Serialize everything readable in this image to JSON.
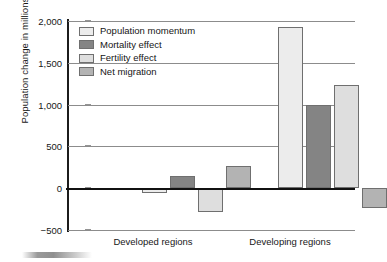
{
  "chart_data": {
    "type": "bar",
    "title": "",
    "xlabel": "",
    "ylabel": "Population change in millions",
    "ylim": [
      -500,
      2000
    ],
    "ytick_labels": [
      "2,000",
      "1,500",
      "1,000",
      "500",
      "0",
      "-500"
    ],
    "ytick_values": [
      2000,
      1500,
      1000,
      500,
      0,
      -500
    ],
    "grid": true,
    "legend_position": "upper-left-inside",
    "categories": [
      "Developed regions",
      "Developing regions"
    ],
    "series": [
      {
        "name": "Population momentum",
        "color": "#ececec",
        "values": [
          -60,
          1925
        ]
      },
      {
        "name": "Mortality effect",
        "color": "#848484",
        "values": [
          140,
          1000
        ]
      },
      {
        "name": "Fertility effect",
        "color": "#dedede",
        "values": [
          -290,
          1240
        ]
      },
      {
        "name": "Net migration",
        "color": "#b3b3b3",
        "values": [
          270,
          -240
        ]
      }
    ]
  },
  "legend": {
    "items": [
      {
        "label": "Population momentum"
      },
      {
        "label": "Mortality effect"
      },
      {
        "label": "Fertility effect"
      },
      {
        "label": "Net migration"
      }
    ]
  },
  "axis": {
    "y_title": "Population change in millions"
  }
}
